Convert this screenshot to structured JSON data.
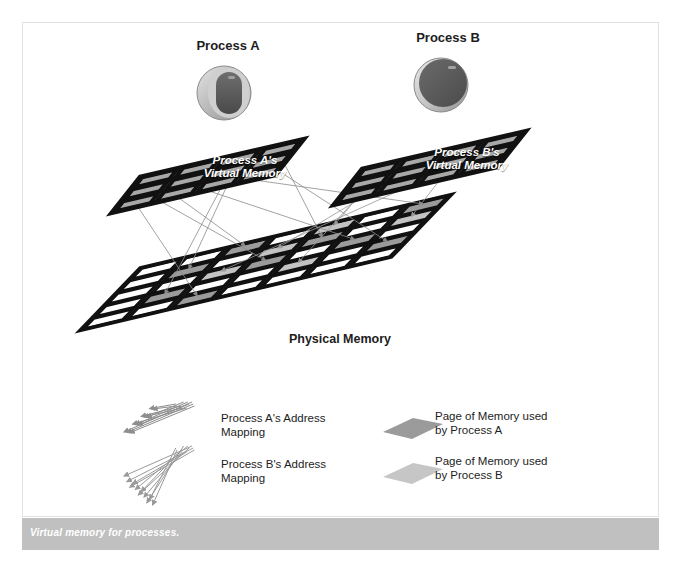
{
  "figure": {
    "caption": "Virtual memory for processes.",
    "caption_bar_color": "#c0c0c0",
    "background": "#ffffff"
  },
  "processes": [
    {
      "id": "a",
      "label": "Process A",
      "icon": "process-disk-icon",
      "icon_style": "light-ring-dark-core",
      "vm_label_line1": "Process A's",
      "vm_label_line2": "Virtual Memory",
      "page_color": "#9b9b9b",
      "arrow_color": "#8c8c8c"
    },
    {
      "id": "b",
      "label": "Process B",
      "icon": "process-disk-icon",
      "icon_style": "solid-dark",
      "vm_label_line1": "Process B's",
      "vm_label_line2": "Virtual Memory",
      "page_color": "#c3c3c3",
      "arrow_color": "#9a9a9a"
    }
  ],
  "physical_memory": {
    "label": "Physical Memory",
    "columns": 7,
    "rows": 5,
    "empty_color": "#ffffff",
    "border_color": "#111111"
  },
  "virtual_memory": {
    "columns": 4,
    "rows": 3,
    "cell_color": "#a8a8a8",
    "border_color": "#111111"
  },
  "legend": {
    "items": [
      {
        "key": "mapping-a",
        "icon": "arrow-bundle-icon",
        "line1": "Process A's Address",
        "line2": "Mapping",
        "color": "#8c8c8c"
      },
      {
        "key": "mapping-b",
        "icon": "arrow-bundle-icon",
        "line1": "Process B's Address",
        "line2": "Mapping",
        "color": "#9a9a9a"
      },
      {
        "key": "page-a",
        "icon": "page-parallelogram-icon",
        "line1": "Page of Memory used",
        "line2": "by Process A",
        "color": "#9b9b9b"
      },
      {
        "key": "page-b",
        "icon": "page-parallelogram-icon",
        "line1": "Page of Memory used",
        "line2": "by Process B",
        "color": "#c6c6c6"
      }
    ]
  },
  "chart_data": {
    "type": "diagram",
    "title": "Virtual memory for processes.",
    "physical_grid_fill": [
      [
        0,
        0,
        1,
        0,
        2,
        0,
        1
      ],
      [
        0,
        1,
        0,
        2,
        1,
        0,
        2
      ],
      [
        0,
        0,
        2,
        1,
        0,
        1,
        0
      ],
      [
        0,
        1,
        0,
        0,
        2,
        0,
        1
      ],
      [
        0,
        0,
        1,
        0,
        0,
        0,
        0
      ]
    ],
    "fill_legend": {
      "0": "empty",
      "1": "process-a-page",
      "2": "process-b-page"
    },
    "virtual_a_fill": [
      [
        1,
        1,
        1,
        1
      ],
      [
        1,
        1,
        1,
        1
      ],
      [
        1,
        1,
        1,
        1
      ]
    ],
    "virtual_b_fill": [
      [
        1,
        1,
        1,
        1
      ],
      [
        1,
        1,
        1,
        1
      ],
      [
        1,
        1,
        1,
        1
      ]
    ]
  }
}
